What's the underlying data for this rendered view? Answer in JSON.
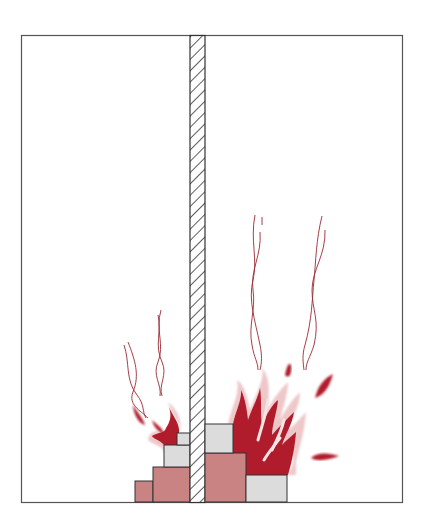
{
  "diagram": {
    "title": "",
    "colors": {
      "frame": "#555555",
      "wall_hatch": "#333333",
      "fuel_pink": "#c98383",
      "fuel_gray": "#dcdcdc",
      "flame": "#b01c2b",
      "flame_halo": "#eec7c9",
      "smoke": "#9a2a35"
    },
    "rooms": [
      {
        "name": "left-room",
        "fuel_blocks": 4,
        "fire_size": "small"
      },
      {
        "name": "right-room",
        "fuel_blocks": 3,
        "fire_size": "large"
      }
    ],
    "wall": {
      "type": "hatched-partition"
    }
  }
}
